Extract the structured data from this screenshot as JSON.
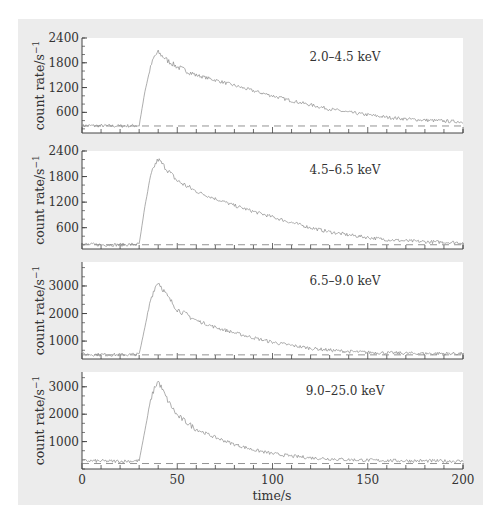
{
  "chart_data": [
    {
      "type": "line",
      "title": "2.0–4.5 keV",
      "xlabel": "time/s",
      "ylabel": "count rate/s⁻¹",
      "xlim": [
        0,
        200
      ],
      "ylim": [
        100,
        2400
      ],
      "yticks": [
        600,
        1200,
        1800,
        2400
      ],
      "xticks": [
        0,
        50,
        100,
        150,
        200
      ],
      "background_level": 270,
      "rise_start_s": 30,
      "peak_time_s": 40,
      "peak_value": 2050,
      "x": [
        0,
        10,
        20,
        30,
        33,
        36,
        38,
        40,
        45,
        50,
        60,
        70,
        80,
        90,
        100,
        110,
        120,
        130,
        140,
        150,
        160,
        170,
        180,
        190,
        200
      ],
      "values": [
        280,
        275,
        270,
        280,
        1100,
        1700,
        1950,
        2050,
        1850,
        1700,
        1500,
        1380,
        1250,
        1120,
        1000,
        880,
        780,
        680,
        600,
        540,
        480,
        440,
        410,
        390,
        370
      ]
    },
    {
      "type": "line",
      "title": "4.5–6.5 keV",
      "xlabel": "time/s",
      "ylabel": "count rate/s⁻¹",
      "xlim": [
        0,
        200
      ],
      "ylim": [
        100,
        2400
      ],
      "yticks": [
        600,
        1200,
        1800,
        2400
      ],
      "xticks": [
        0,
        50,
        100,
        150,
        200
      ],
      "background_level": 200,
      "rise_start_s": 30,
      "peak_time_s": 40,
      "peak_value": 2200,
      "x": [
        0,
        10,
        20,
        30,
        33,
        36,
        38,
        40,
        45,
        50,
        60,
        70,
        80,
        90,
        100,
        110,
        120,
        130,
        140,
        150,
        160,
        170,
        180,
        190,
        200
      ],
      "values": [
        210,
        200,
        200,
        210,
        1100,
        1800,
        2050,
        2200,
        1950,
        1700,
        1450,
        1280,
        1120,
        980,
        850,
        720,
        600,
        500,
        430,
        370,
        320,
        290,
        270,
        260,
        250
      ]
    },
    {
      "type": "line",
      "title": "6.5–9.0 keV",
      "xlabel": "time/s",
      "ylabel": "count rate/s⁻¹",
      "xlim": [
        0,
        200
      ],
      "ylim": [
        350,
        3870
      ],
      "yticks": [
        1000,
        2000,
        3000
      ],
      "xticks": [
        0,
        50,
        100,
        150,
        200
      ],
      "background_level": 500,
      "rise_start_s": 30,
      "peak_time_s": 40,
      "peak_value": 3150,
      "x": [
        0,
        10,
        20,
        30,
        33,
        36,
        38,
        40,
        45,
        50,
        60,
        70,
        80,
        90,
        100,
        110,
        120,
        130,
        140,
        150,
        160,
        170,
        180,
        190,
        200
      ],
      "values": [
        520,
        510,
        500,
        520,
        1500,
        2500,
        2900,
        3150,
        2600,
        2150,
        1750,
        1500,
        1300,
        1120,
        960,
        840,
        740,
        670,
        620,
        590,
        570,
        560,
        550,
        550,
        545
      ]
    },
    {
      "type": "line",
      "title": "9.0–25.0 keV",
      "xlabel": "time/s",
      "ylabel": "count rate/s⁻¹",
      "xlim": [
        0,
        200
      ],
      "ylim": [
        0,
        3540
      ],
      "yticks": [
        1000,
        2000,
        3000
      ],
      "xticks": [
        0,
        50,
        100,
        150,
        200
      ],
      "xticklabels": [
        "0",
        "50",
        "100",
        "150",
        "200"
      ],
      "background_level": 200,
      "rise_start_s": 30,
      "peak_time_s": 40,
      "peak_value": 3200,
      "x": [
        0,
        10,
        20,
        30,
        33,
        36,
        38,
        40,
        45,
        50,
        60,
        70,
        80,
        90,
        100,
        110,
        120,
        130,
        140,
        150,
        160,
        170,
        180,
        190,
        200
      ],
      "values": [
        300,
        290,
        280,
        300,
        1400,
        2500,
        2950,
        3200,
        2500,
        1950,
        1450,
        1150,
        900,
        700,
        560,
        470,
        410,
        370,
        340,
        320,
        310,
        300,
        295,
        290,
        285
      ]
    }
  ],
  "labels": {
    "ylabel": "count rate/s",
    "ylabel_exp": "−1",
    "xlabel": "time/s",
    "bands": [
      "2.0–4.5 keV",
      "4.5–6.5 keV",
      "6.5–9.0 keV",
      "9.0–25.0 keV"
    ],
    "xticks": [
      "0",
      "50",
      "100",
      "150",
      "200"
    ],
    "yticks_p1": [
      "2400",
      "1800",
      "1200",
      "600"
    ],
    "yticks_p2": [
      "2400",
      "1800",
      "1200",
      "600"
    ],
    "yticks_p3": [
      "3000",
      "2000",
      "1000"
    ],
    "yticks_p4": [
      "3000",
      "2000",
      "1000"
    ]
  },
  "colors": {
    "background_panel": "#ececec",
    "plot_area": "#ffffff",
    "curve": "#8a8a8a",
    "axis": "#444444",
    "dashed": "#777777"
  }
}
